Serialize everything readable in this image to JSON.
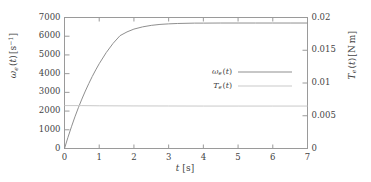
{
  "chart_data": {
    "type": "line",
    "title": "",
    "xlabel": "t [s]",
    "ylabel": "ωe (t) [s⁻¹]",
    "ylabel_right": "Te (t) [N m]",
    "xlim": [
      0,
      7
    ],
    "ylim": [
      0,
      7000
    ],
    "ylim_right": [
      0,
      0.02
    ],
    "grid": false,
    "legend_position": "center-right-inside",
    "xticks": [
      "0",
      "1",
      "2",
      "3",
      "4",
      "5",
      "6",
      "7"
    ],
    "xtick_values": [
      0,
      1,
      2,
      3,
      4,
      5,
      6,
      7
    ],
    "yticks_left": [
      "0",
      "1000",
      "2000",
      "3000",
      "4000",
      "5000",
      "6000",
      "7000"
    ],
    "ytick_values_left": [
      0,
      1000,
      2000,
      3000,
      4000,
      5000,
      6000,
      7000
    ],
    "yticks_right": [
      "0",
      "0.005",
      "0.01",
      "0.015",
      "0.02"
    ],
    "ytick_values_right": [
      0,
      0.005,
      0.01,
      0.015,
      0.02
    ],
    "series": [
      {
        "name": "omega_e",
        "legend_label": "ωe (t)",
        "axis": "left",
        "color": "#8f8f8f",
        "x": [
          0.0,
          0.1,
          0.2,
          0.3,
          0.4,
          0.5,
          0.6,
          0.7,
          0.8,
          0.9,
          1.0,
          1.2,
          1.4,
          1.6,
          1.8,
          2.0,
          2.25,
          2.5,
          2.75,
          3.0,
          3.25,
          3.5,
          3.75,
          4.0,
          4.5,
          5.0,
          5.5,
          6.0,
          6.5,
          7.0
        ],
        "values": [
          0,
          600,
          1160,
          1690,
          2180,
          2640,
          3070,
          3470,
          3850,
          4200,
          4530,
          5120,
          5620,
          6030,
          6230,
          6380,
          6500,
          6580,
          6630,
          6660,
          6680,
          6690,
          6700,
          6700,
          6705,
          6705,
          6705,
          6705,
          6705,
          6705
        ]
      },
      {
        "name": "T_e",
        "legend_label": "Te (t)",
        "axis": "right",
        "color": "#c9c9c9",
        "x": [
          0.0,
          0.5,
          1.0,
          2.0,
          3.0,
          4.0,
          5.0,
          6.0,
          7.0
        ],
        "values": [
          0.00655,
          0.00655,
          0.00652,
          0.0065,
          0.00649,
          0.00648,
          0.00648,
          0.00648,
          0.00648
        ]
      }
    ]
  },
  "style": {
    "frame_color": "#9a9a9a",
    "text_color": "#444444",
    "background": "#ffffff"
  }
}
